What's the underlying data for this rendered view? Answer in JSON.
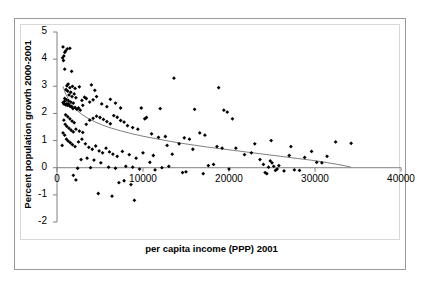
{
  "chart_data": {
    "type": "scatter",
    "title": "",
    "xlabel": "per capita income (PPP) 2001",
    "ylabel": "Percent population growth 2000-2001",
    "xlim": [
      0,
      40000
    ],
    "ylim": [
      -2,
      5
    ],
    "xticks": [
      0,
      10000,
      20000,
      30000,
      40000
    ],
    "xtick_labels": [
      "0",
      "10000",
      "20000",
      "30000",
      "40000"
    ],
    "yticks": [
      -2,
      -1,
      0,
      1,
      2,
      3,
      4,
      5
    ],
    "ytick_labels": [
      "-2",
      "-1",
      "0",
      "1",
      "2",
      "3",
      "4",
      "5"
    ],
    "grid": false,
    "legend": false,
    "marker": "diamond",
    "marker_color": "#000000",
    "trendline": {
      "type": "logarithmic",
      "color": "#7f7f7f",
      "x_start": 700,
      "x_end": 34200,
      "points": [
        [
          700,
          3.0
        ],
        [
          1000,
          2.72
        ],
        [
          1400,
          2.48
        ],
        [
          1800,
          2.3
        ],
        [
          2300,
          2.12
        ],
        [
          2900,
          1.96
        ],
        [
          3600,
          1.82
        ],
        [
          4400,
          1.69
        ],
        [
          5300,
          1.57
        ],
        [
          6300,
          1.46
        ],
        [
          7400,
          1.36
        ],
        [
          8600,
          1.26
        ],
        [
          10000,
          1.16
        ],
        [
          11500,
          1.07
        ],
        [
          13000,
          0.98
        ],
        [
          14500,
          0.9
        ],
        [
          16000,
          0.83
        ],
        [
          17500,
          0.76
        ],
        [
          19000,
          0.7
        ],
        [
          20500,
          0.64
        ],
        [
          22000,
          0.58
        ],
        [
          23500,
          0.52
        ],
        [
          25000,
          0.46
        ],
        [
          26500,
          0.4
        ],
        [
          28000,
          0.34
        ],
        [
          29500,
          0.28
        ],
        [
          31000,
          0.21
        ],
        [
          32500,
          0.13
        ],
        [
          33500,
          0.07
        ],
        [
          34200,
          0.02
        ]
      ]
    },
    "points": [
      [
        700,
        4.45
      ],
      [
        900,
        4.25
      ],
      [
        800,
        4.12
      ],
      [
        650,
        4.05
      ],
      [
        1000,
        4.3
      ],
      [
        1200,
        4.38
      ],
      [
        750,
        3.95
      ],
      [
        1500,
        4.4
      ],
      [
        900,
        3.63
      ],
      [
        1700,
        3.55
      ],
      [
        1300,
        3.08
      ],
      [
        1150,
        3.02
      ],
      [
        1500,
        2.95
      ],
      [
        1050,
        2.88
      ],
      [
        1250,
        2.82
      ],
      [
        1600,
        2.78
      ],
      [
        2000,
        2.72
      ],
      [
        1400,
        2.68
      ],
      [
        1750,
        2.62
      ],
      [
        2200,
        2.58
      ],
      [
        900,
        2.55
      ],
      [
        1100,
        2.5
      ],
      [
        1350,
        2.46
      ],
      [
        1600,
        2.42
      ],
      [
        1900,
        2.38
      ],
      [
        800,
        2.35
      ],
      [
        1000,
        2.32
      ],
      [
        1200,
        2.3
      ],
      [
        1450,
        2.28
      ],
      [
        1700,
        2.25
      ],
      [
        2100,
        2.22
      ],
      [
        2500,
        2.2
      ],
      [
        700,
        2.4
      ],
      [
        850,
        2.44
      ],
      [
        1150,
        2.36
      ],
      [
        1350,
        2.34
      ],
      [
        1550,
        2.26
      ],
      [
        1850,
        2.18
      ],
      [
        2300,
        2.15
      ],
      [
        2700,
        2.12
      ],
      [
        3000,
        2.3
      ],
      [
        3400,
        2.55
      ],
      [
        3200,
        2.6
      ],
      [
        2900,
        2.48
      ],
      [
        3800,
        2.42
      ],
      [
        4200,
        2.5
      ],
      [
        4600,
        2.62
      ],
      [
        5200,
        2.35
      ],
      [
        5800,
        2.25
      ],
      [
        6200,
        2.52
      ],
      [
        6800,
        2.38
      ],
      [
        7400,
        2.2
      ],
      [
        4000,
        3.05
      ],
      [
        4400,
        2.85
      ],
      [
        2600,
        2.98
      ],
      [
        2100,
        2.92
      ],
      [
        1800,
        3.0
      ],
      [
        1000,
        1.95
      ],
      [
        1250,
        1.88
      ],
      [
        1500,
        1.8
      ],
      [
        1750,
        1.72
      ],
      [
        2000,
        1.66
      ],
      [
        800,
        1.75
      ],
      [
        950,
        1.6
      ],
      [
        1150,
        1.52
      ],
      [
        1400,
        1.45
      ],
      [
        1650,
        1.38
      ],
      [
        1900,
        1.32
      ],
      [
        2200,
        1.42
      ],
      [
        2600,
        1.35
      ],
      [
        3000,
        1.3
      ],
      [
        3400,
        1.6
      ],
      [
        3800,
        1.75
      ],
      [
        4200,
        1.82
      ],
      [
        4600,
        1.9
      ],
      [
        5000,
        1.85
      ],
      [
        5400,
        1.78
      ],
      [
        5800,
        1.7
      ],
      [
        6200,
        1.62
      ],
      [
        6600,
        1.92
      ],
      [
        7000,
        1.86
      ],
      [
        7400,
        1.74
      ],
      [
        7800,
        1.68
      ],
      [
        8200,
        1.55
      ],
      [
        8800,
        1.48
      ],
      [
        9400,
        1.42
      ],
      [
        10200,
        1.8
      ],
      [
        11000,
        1.25
      ],
      [
        11800,
        1.12
      ],
      [
        12600,
        1.15
      ],
      [
        13400,
        0.5
      ],
      [
        14200,
        0.88
      ],
      [
        700,
        1.28
      ],
      [
        900,
        1.2
      ],
      [
        1100,
        1.05
      ],
      [
        1300,
        0.98
      ],
      [
        1550,
        0.92
      ],
      [
        1800,
        0.85
      ],
      [
        2100,
        0.78
      ],
      [
        600,
        0.82
      ],
      [
        2500,
        0.95
      ],
      [
        2900,
        1.05
      ],
      [
        3300,
        0.88
      ],
      [
        3700,
        0.75
      ],
      [
        4100,
        0.68
      ],
      [
        4500,
        0.8
      ],
      [
        4900,
        0.62
      ],
      [
        5300,
        0.55
      ],
      [
        5700,
        0.72
      ],
      [
        6100,
        0.58
      ],
      [
        6500,
        0.5
      ],
      [
        7000,
        0.42
      ],
      [
        3500,
        0.35
      ],
      [
        4300,
        0.28
      ],
      [
        5100,
        0.18
      ],
      [
        2800,
        0.3
      ],
      [
        7600,
        0.6
      ],
      [
        8400,
        0.48
      ],
      [
        9200,
        0.35
      ],
      [
        10000,
        0.55
      ],
      [
        10800,
        0.2
      ],
      [
        8000,
        0.05
      ],
      [
        8800,
        0.02
      ],
      [
        9600,
        -0.05
      ],
      [
        6000,
        0.02
      ],
      [
        6800,
        -0.02
      ],
      [
        3900,
        0.0
      ],
      [
        2400,
        -0.02
      ],
      [
        1900,
        -0.28
      ],
      [
        2200,
        -0.45
      ],
      [
        4800,
        -0.95
      ],
      [
        6400,
        -1.05
      ],
      [
        7200,
        -0.55
      ],
      [
        7800,
        -0.48
      ],
      [
        8600,
        -0.62
      ],
      [
        9000,
        -1.2
      ],
      [
        11400,
        -0.08
      ],
      [
        12200,
        0.0
      ],
      [
        13000,
        0.05
      ],
      [
        14600,
        -0.18
      ],
      [
        15400,
        1.05
      ],
      [
        15800,
        0.68
      ],
      [
        16600,
        1.28
      ],
      [
        17200,
        1.2
      ],
      [
        17000,
        -0.22
      ],
      [
        17600,
        0.08
      ],
      [
        18200,
        0.12
      ],
      [
        13600,
        3.3
      ],
      [
        18800,
        2.95
      ],
      [
        19400,
        2.12
      ],
      [
        19800,
        2.05
      ],
      [
        20400,
        1.8
      ],
      [
        18600,
        0.78
      ],
      [
        19200,
        0.72
      ],
      [
        20000,
        -0.05
      ],
      [
        20800,
        0.72
      ],
      [
        16000,
        2.15
      ],
      [
        14800,
        1.1
      ],
      [
        12000,
        2.18
      ],
      [
        10400,
        1.85
      ],
      [
        9800,
        2.2
      ],
      [
        11200,
        0.45
      ],
      [
        12800,
        0.82
      ],
      [
        15000,
        -0.15
      ],
      [
        23600,
        0.3
      ],
      [
        24000,
        0.12
      ],
      [
        24200,
        -0.18
      ],
      [
        24400,
        -0.22
      ],
      [
        24600,
        0.02
      ],
      [
        24800,
        0.25
      ],
      [
        25000,
        0.18
      ],
      [
        25200,
        0.05
      ],
      [
        25400,
        -0.1
      ],
      [
        25600,
        -0.05
      ],
      [
        25800,
        0.08
      ],
      [
        24900,
        1.0
      ],
      [
        26400,
        -0.12
      ],
      [
        27000,
        0.45
      ],
      [
        27600,
        -0.08
      ],
      [
        28200,
        -0.1
      ],
      [
        27200,
        0.78
      ],
      [
        28800,
        0.38
      ],
      [
        29600,
        0.6
      ],
      [
        30200,
        0.2
      ],
      [
        30800,
        0.18
      ],
      [
        31400,
        0.42
      ],
      [
        32400,
        0.95
      ],
      [
        34200,
        0.9
      ],
      [
        21800,
        0.48
      ],
      [
        22600,
        0.55
      ],
      [
        23000,
        0.88
      ]
    ]
  }
}
